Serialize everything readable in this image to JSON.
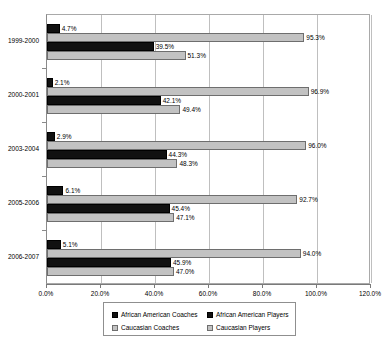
{
  "chart_data": {
    "type": "bar",
    "orientation": "horizontal",
    "title": "",
    "xlabel": "",
    "ylabel": "",
    "xlim": [
      0,
      120
    ],
    "grid": true,
    "legend_position": "bottom",
    "categories": [
      "1999-2000",
      "2000-2001",
      "2003-2004",
      "2005-2006",
      "2006-2007"
    ],
    "xtick_labels": [
      "0.0%",
      "20.0%",
      "40.0%",
      "60.0%",
      "80.0%",
      "100.0%",
      "120.0%"
    ],
    "xtick_values": [
      0,
      20,
      40,
      60,
      80,
      100,
      120
    ],
    "series": [
      {
        "name": "African American Coaches",
        "color": "#111111",
        "values": [
          4.7,
          2.1,
          2.9,
          6.1,
          5.1
        ],
        "labels": [
          "4.7%",
          "2.1%",
          "2.9%",
          "6.1%",
          "5.1%"
        ]
      },
      {
        "name": "Caucasian Coaches",
        "color": "#c2c2c2",
        "values": [
          95.3,
          96.9,
          96.0,
          92.7,
          94.0
        ],
        "labels": [
          "95.3%",
          "96.9%",
          "96.0%",
          "92.7%",
          "94.0%"
        ]
      },
      {
        "name": "African American Players",
        "color": "#111111",
        "values": [
          39.5,
          42.1,
          44.3,
          45.4,
          45.9
        ],
        "labels": [
          "39.5%",
          "42.1%",
          "44.3%",
          "45.4%",
          "45.9%"
        ]
      },
      {
        "name": "Caucasian Players",
        "color": "#c2c2c2",
        "values": [
          51.3,
          49.4,
          48.3,
          47.1,
          47.0
        ],
        "labels": [
          "51.3%",
          "49.4%",
          "48.3%",
          "47.1%",
          "47.0%"
        ]
      }
    ]
  },
  "legend": {
    "entries": [
      {
        "label": "African American Coaches",
        "swatch": "dark"
      },
      {
        "label": "African American Players",
        "swatch": "dark"
      },
      {
        "label": "Caucasian Coaches",
        "swatch": "light"
      },
      {
        "label": "Caucasian Players",
        "swatch": "light"
      }
    ]
  }
}
